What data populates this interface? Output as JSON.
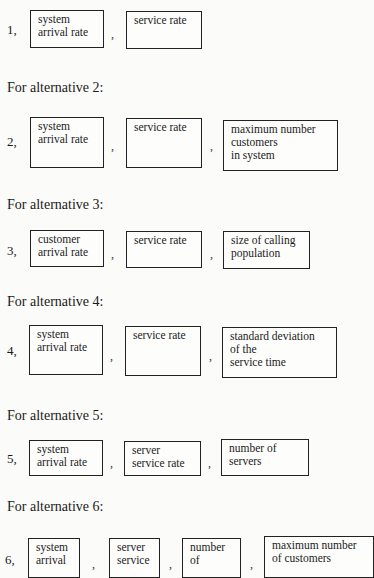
{
  "alternatives": [
    {
      "number": "1,",
      "heading": "",
      "boxes": [
        {
          "lines": [
            "system",
            "arrival rate"
          ]
        },
        {
          "lines": [
            "service rate"
          ]
        }
      ]
    },
    {
      "number": "2,",
      "heading": "For alternative 2:",
      "boxes": [
        {
          "lines": [
            "system",
            "arrival rate"
          ]
        },
        {
          "lines": [
            "service rate"
          ]
        },
        {
          "lines": [
            "maximum number",
            "customers",
            "in system"
          ]
        }
      ]
    },
    {
      "number": "3,",
      "heading": "For alternative 3:",
      "boxes": [
        {
          "lines": [
            "customer",
            "arrival rate"
          ]
        },
        {
          "lines": [
            "service rate"
          ]
        },
        {
          "lines": [
            "size of calling",
            "population"
          ]
        }
      ]
    },
    {
      "number": "4,",
      "heading": "For alternative 4:",
      "boxes": [
        {
          "lines": [
            "system",
            "arrival rate"
          ]
        },
        {
          "lines": [
            "service rate"
          ]
        },
        {
          "lines": [
            "standard deviation",
            "of the",
            "service time"
          ]
        }
      ]
    },
    {
      "number": "5,",
      "heading": "For alternative 5:",
      "boxes": [
        {
          "lines": [
            "system",
            "arrival rate"
          ]
        },
        {
          "lines": [
            "server",
            "service rate"
          ]
        },
        {
          "lines": [
            "number of",
            "servers"
          ]
        }
      ]
    },
    {
      "number": "6,",
      "heading": "For alternative 6:",
      "boxes": [
        {
          "lines": [
            "system",
            "arrival"
          ]
        },
        {
          "lines": [
            "server",
            "service"
          ]
        },
        {
          "lines": [
            "number",
            "of"
          ]
        },
        {
          "lines": [
            "maximum number",
            "of customers"
          ]
        }
      ]
    }
  ],
  "separator": ","
}
